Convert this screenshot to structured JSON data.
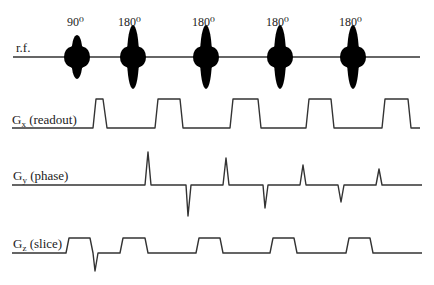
{
  "diagram": {
    "line_color": "#333333",
    "pulse_color": "#000000",
    "rows": [
      {
        "id": "rf",
        "label": "r.f.",
        "label_x": 16,
        "label_y": 52,
        "baseline_y": 57,
        "x_start": 13,
        "x_end": 420
      },
      {
        "id": "gx",
        "label": "Gx (readout)",
        "label_main": "G",
        "label_sub": "x",
        "label_rest": " (readout)",
        "label_x": 12,
        "label_y": 124,
        "baseline_y": 128,
        "x_start": 12,
        "x_end": 420
      },
      {
        "id": "gy",
        "label": "Gy (phase)",
        "label_main": "G",
        "label_sub": "y",
        "label_rest": " (phase)",
        "label_x": 13,
        "label_y": 180,
        "baseline_y": 185,
        "x_start": 12,
        "x_end": 422
      },
      {
        "id": "gz",
        "label": "Gz (slice)",
        "label_main": "G",
        "label_sub": "z",
        "label_rest": " (slice)",
        "label_x": 13,
        "label_y": 248,
        "baseline_y": 253,
        "x_start": 12,
        "x_end": 422
      }
    ],
    "rf_pulses": [
      {
        "angle": "90⁰",
        "cx": 77,
        "half_height": 22,
        "label_x": 67
      },
      {
        "angle": "180⁰",
        "cx": 133,
        "half_height": 32,
        "label_x": 118
      },
      {
        "angle": "180⁰",
        "cx": 206,
        "half_height": 32,
        "label_x": 192
      },
      {
        "angle": "180⁰",
        "cx": 280,
        "half_height": 32,
        "label_x": 266
      },
      {
        "angle": "180⁰",
        "cx": 353,
        "half_height": 32,
        "label_x": 339
      }
    ],
    "rf_label_y": 26,
    "gx_path": [
      [
        12,
        128
      ],
      [
        93,
        128
      ],
      [
        96,
        99
      ],
      [
        103,
        99
      ],
      [
        107,
        128
      ],
      [
        155,
        128
      ],
      [
        158,
        99
      ],
      [
        180,
        99
      ],
      [
        183,
        128
      ],
      [
        230,
        128
      ],
      [
        233,
        99
      ],
      [
        258,
        99
      ],
      [
        261,
        128
      ],
      [
        306,
        128
      ],
      [
        309,
        99
      ],
      [
        331,
        99
      ],
      [
        334,
        128
      ],
      [
        382,
        128
      ],
      [
        385,
        99
      ],
      [
        408,
        99
      ],
      [
        411,
        128
      ],
      [
        420,
        128
      ]
    ],
    "gy_path": [
      [
        12,
        185
      ],
      [
        145,
        185
      ],
      [
        148,
        152
      ],
      [
        151,
        185
      ],
      [
        186,
        185
      ],
      [
        188,
        216
      ],
      [
        191,
        185
      ],
      [
        223,
        185
      ],
      [
        226,
        158
      ],
      [
        229,
        185
      ],
      [
        263,
        185
      ],
      [
        265,
        208
      ],
      [
        268,
        185
      ],
      [
        300,
        185
      ],
      [
        303,
        165
      ],
      [
        306,
        185
      ],
      [
        338,
        185
      ],
      [
        341,
        202
      ],
      [
        344,
        185
      ],
      [
        376,
        185
      ],
      [
        379,
        169
      ],
      [
        382,
        185
      ],
      [
        422,
        185
      ]
    ],
    "gz_path": [
      [
        12,
        253
      ],
      [
        66,
        253
      ],
      [
        69,
        238
      ],
      [
        90,
        238
      ],
      [
        93,
        253
      ],
      [
        95,
        271
      ],
      [
        98,
        253
      ],
      [
        120,
        253
      ],
      [
        123,
        238
      ],
      [
        145,
        238
      ],
      [
        148,
        253
      ],
      [
        196,
        253
      ],
      [
        199,
        238
      ],
      [
        220,
        238
      ],
      [
        223,
        253
      ],
      [
        270,
        253
      ],
      [
        273,
        238
      ],
      [
        294,
        238
      ],
      [
        297,
        253
      ],
      [
        346,
        253
      ],
      [
        349,
        238
      ],
      [
        370,
        238
      ],
      [
        373,
        253
      ],
      [
        422,
        253
      ]
    ]
  }
}
